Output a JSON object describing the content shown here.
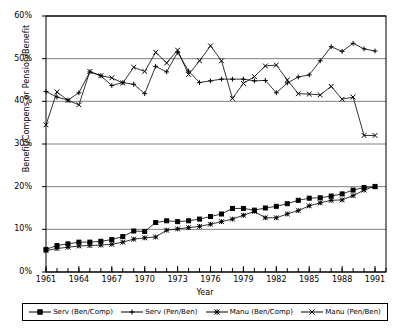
{
  "chart_data": {
    "type": "line",
    "title": "",
    "xlabel": "Year",
    "ylabel": "Benefit/Compens or Pension/Benefit",
    "xlim": [
      1961,
      1992
    ],
    "ylim": [
      0,
      60
    ],
    "ytick_labels": [
      "0%",
      "10%",
      "20%",
      "30%",
      "40%",
      "50%",
      "60%"
    ],
    "ytick_values": [
      0,
      10,
      20,
      30,
      40,
      50,
      60
    ],
    "xtick_labels": [
      "1961",
      "1964",
      "1967",
      "1970",
      "1973",
      "1976",
      "1979",
      "1982",
      "1985",
      "1988",
      "1991"
    ],
    "xtick_values": [
      1961,
      1964,
      1967,
      1970,
      1973,
      1976,
      1979,
      1982,
      1985,
      1988,
      1991
    ],
    "grid": "horizontal",
    "legend_position": "bottom",
    "x": [
      1961,
      1962,
      1963,
      1964,
      1965,
      1966,
      1967,
      1968,
      1969,
      1970,
      1971,
      1972,
      1973,
      1974,
      1975,
      1976,
      1977,
      1978,
      1979,
      1980,
      1981,
      1982,
      1983,
      1984,
      1985,
      1986,
      1987,
      1988,
      1989,
      1990,
      1991
    ],
    "series": [
      {
        "name": "Serv (Ben/Comp)",
        "marker": "filled-square",
        "values": [
          5.3,
          6.2,
          6.6,
          7.0,
          7.0,
          7.2,
          7.6,
          8.3,
          9.6,
          9.5,
          11.6,
          12.0,
          11.8,
          12.0,
          12.4,
          13.0,
          13.6,
          14.9,
          14.9,
          14.5,
          15.0,
          15.4,
          16.0,
          16.8,
          17.3,
          17.4,
          17.8,
          18.3,
          19.2,
          19.8,
          20.0
        ]
      },
      {
        "name": "Serv (Pen/Ben)",
        "marker": "plus",
        "values": [
          42.3,
          41.0,
          40.3,
          42.0,
          46.9,
          46.0,
          43.7,
          44.4,
          44.0,
          41.8,
          48.2,
          46.9,
          51.5,
          47.1,
          44.4,
          44.8,
          45.2,
          45.2,
          45.2,
          44.8,
          44.9,
          42.0,
          44.3,
          45.7,
          46.2,
          49.5,
          52.8,
          51.7,
          53.6,
          52.3,
          51.8
        ]
      },
      {
        "name": "Manu (Ben/Comp)",
        "marker": "star",
        "values": [
          5.0,
          5.5,
          5.8,
          6.1,
          6.2,
          6.3,
          6.5,
          7.0,
          7.7,
          8.0,
          8.2,
          9.8,
          10.1,
          10.4,
          10.7,
          11.2,
          11.8,
          12.4,
          13.3,
          14.2,
          12.7,
          12.7,
          13.6,
          14.4,
          15.5,
          16.2,
          16.8,
          16.9,
          17.9,
          19.2,
          20.1
        ]
      },
      {
        "name": "Manu (Pen/Ben)",
        "marker": "x",
        "values": [
          34.5,
          42.2,
          40.2,
          39.2,
          47.0,
          46.0,
          45.5,
          44.3,
          48.0,
          47.0,
          51.5,
          49.0,
          52.0,
          46.3,
          49.5,
          53.0,
          49.5,
          40.7,
          44.2,
          45.8,
          48.3,
          48.5,
          45.0,
          41.8,
          41.7,
          41.5,
          43.5,
          40.5,
          41.0,
          32.0,
          32.0
        ]
      }
    ]
  },
  "legend": {
    "items": [
      {
        "label": "Serv (Ben/Comp)",
        "marker": "filled-square"
      },
      {
        "label": "Serv (Pen/Ben)",
        "marker": "plus"
      },
      {
        "label": "Manu (Ben/Comp)",
        "marker": "star"
      },
      {
        "label": "Manu (Pen/Ben)",
        "marker": "x"
      }
    ]
  },
  "colors": {
    "line": "#000000",
    "grid": "#808080",
    "axis": "#000000",
    "background": "#ffffff"
  }
}
